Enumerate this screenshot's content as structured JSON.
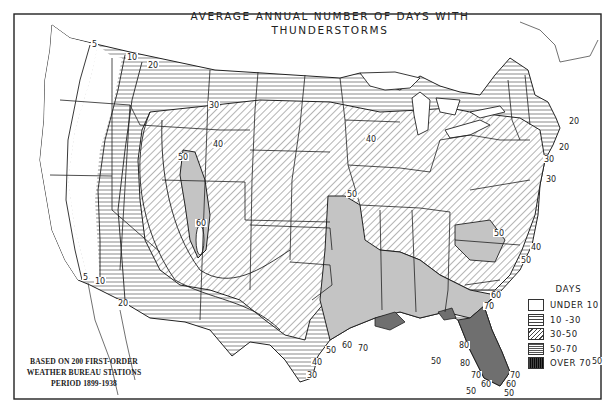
{
  "map": {
    "title_line1": "AVERAGE ANNUAL NUMBER OF DAYS WITH",
    "title_line2": "THUNDERSTORMS",
    "notes": {
      "line1": "BASED ON 200 FIRST-ORDER",
      "line2": "WEATHER BUREAU STATIONS",
      "line3": "PERIOD 1899-1938"
    },
    "caption": "",
    "legend": {
      "title": "DAYS",
      "items": [
        {
          "label": "UNDER 10",
          "pattern": "blank"
        },
        {
          "label": "10 -30",
          "pattern": "horizontal-lines"
        },
        {
          "label": "30-50",
          "pattern": "diagonal-hatch"
        },
        {
          "label": "50-70",
          "pattern": "dense-horizontal-lines"
        },
        {
          "label": "OVER 70",
          "pattern": "vertical-crosshatch"
        }
      ]
    },
    "contour_labels": [
      {
        "text": "5",
        "x": 92,
        "y": 47
      },
      {
        "text": "10",
        "x": 127,
        "y": 60
      },
      {
        "text": "20",
        "x": 148,
        "y": 68
      },
      {
        "text": "30",
        "x": 209,
        "y": 108
      },
      {
        "text": "40",
        "x": 366,
        "y": 142
      },
      {
        "text": "40",
        "x": 213,
        "y": 147
      },
      {
        "text": "50",
        "x": 178,
        "y": 160
      },
      {
        "text": "50",
        "x": 347,
        "y": 197
      },
      {
        "text": "60",
        "x": 196,
        "y": 226
      },
      {
        "text": "50",
        "x": 592,
        "y": 364
      },
      {
        "text": "5",
        "x": 83,
        "y": 280
      },
      {
        "text": "10",
        "x": 95,
        "y": 284
      },
      {
        "text": "20",
        "x": 118,
        "y": 306
      },
      {
        "text": "20",
        "x": 569,
        "y": 124
      },
      {
        "text": "20",
        "x": 559,
        "y": 150
      },
      {
        "text": "30",
        "x": 544,
        "y": 162
      },
      {
        "text": "30",
        "x": 546,
        "y": 182
      },
      {
        "text": "30",
        "x": 307,
        "y": 378
      },
      {
        "text": "40",
        "x": 312,
        "y": 365
      },
      {
        "text": "50",
        "x": 326,
        "y": 353
      },
      {
        "text": "60",
        "x": 342,
        "y": 348
      },
      {
        "text": "70",
        "x": 358,
        "y": 351
      },
      {
        "text": "50",
        "x": 494,
        "y": 236
      },
      {
        "text": "40",
        "x": 531,
        "y": 250
      },
      {
        "text": "50",
        "x": 521,
        "y": 263
      },
      {
        "text": "60",
        "x": 491,
        "y": 298
      },
      {
        "text": "70",
        "x": 484,
        "y": 309
      },
      {
        "text": "80",
        "x": 459,
        "y": 348
      },
      {
        "text": "80",
        "x": 460,
        "y": 366
      },
      {
        "text": "70",
        "x": 471,
        "y": 378
      },
      {
        "text": "60",
        "x": 481,
        "y": 387
      },
      {
        "text": "50",
        "x": 466,
        "y": 394
      },
      {
        "text": "70",
        "x": 510,
        "y": 378
      },
      {
        "text": "60",
        "x": 506,
        "y": 387
      },
      {
        "text": "50",
        "x": 504,
        "y": 396
      },
      {
        "text": "50",
        "x": 431,
        "y": 364
      }
    ]
  },
  "chart_data": {
    "type": "choropleth-map",
    "title": "AVERAGE ANNUAL NUMBER OF DAYS WITH THUNDERSTORMS",
    "region": "Contiguous United States",
    "legend": [
      "UNDER 10",
      "10 -30",
      "30-50",
      "50-70",
      "OVER 70"
    ],
    "isolines_days": [
      5,
      10,
      20,
      30,
      40,
      50,
      60,
      70,
      80
    ],
    "annotation": "BASED ON 200 FIRST-ORDER WEATHER BUREAU STATIONS PERIOD 1899-1938",
    "zones": [
      {
        "area": "Pacific coast (WA, OR, CA)",
        "days": "under 10"
      },
      {
        "area": "Northern Rockies / Great Basin / Northern Plains / Upper Great Lakes / New England",
        "days": "10-30"
      },
      {
        "area": "Central Plains, Midwest, Mid-Atlantic",
        "days": "30-50"
      },
      {
        "area": "Colorado/New Mexico high plains core",
        "days": "50-60+"
      },
      {
        "area": "Lower Mississippi valley, Gulf states",
        "days": "50-70"
      },
      {
        "area": "Florida peninsula & Gulf coast strip",
        "days": "over 70 (max 80+)"
      }
    ]
  }
}
